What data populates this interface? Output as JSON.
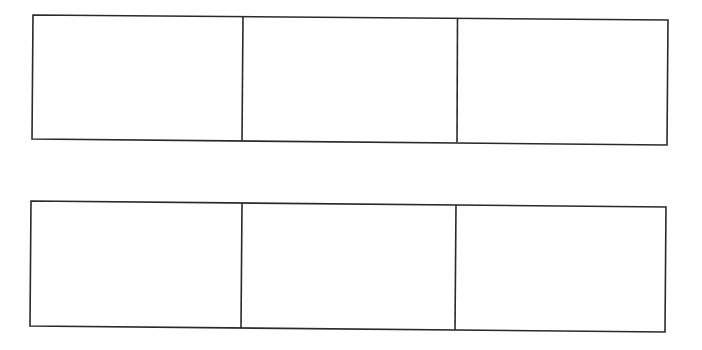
{
  "diagram": {
    "line_color": "#2a2a2a",
    "background": "#ffffff",
    "rows": [
      {
        "cells": [
          "",
          "",
          ""
        ]
      },
      {
        "cells": [
          "",
          "",
          ""
        ]
      }
    ]
  }
}
